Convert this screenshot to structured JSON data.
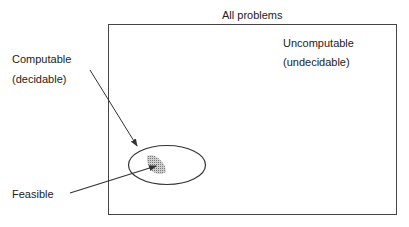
{
  "diagram": {
    "title": "All problems",
    "regions": {
      "uncomputable_line1": "Uncomputable",
      "uncomputable_line2": "(undecidable)",
      "computable_line1": "Computable",
      "computable_line2": "(decidable)",
      "feasible": "Feasible"
    },
    "colors": {
      "stroke": "#333333",
      "shade": "#999999"
    }
  }
}
